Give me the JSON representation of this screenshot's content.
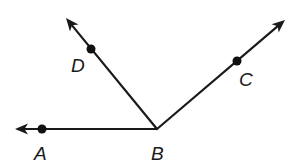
{
  "diagram": {
    "type": "angle-rays",
    "color": "#1a1a1a",
    "vertex": {
      "name": "B",
      "x": 157,
      "y": 129,
      "label": "B",
      "label_x": 151,
      "label_y": 160
    },
    "rays": [
      {
        "id": "ray-BA",
        "to_point": "A",
        "tip": {
          "x": 15,
          "y": 129
        },
        "point": {
          "name": "A",
          "x": 42,
          "y": 129
        },
        "label": "A",
        "label_x": 34,
        "label_y": 160
      },
      {
        "id": "ray-BD",
        "to_point": "D",
        "tip": {
          "x": 66,
          "y": 18
        },
        "point": {
          "name": "D",
          "x": 91,
          "y": 49
        },
        "label": "D",
        "label_x": 71,
        "label_y": 72
      },
      {
        "id": "ray-BC",
        "to_point": "C",
        "tip": {
          "x": 285,
          "y": 20
        },
        "point": {
          "name": "C",
          "x": 237,
          "y": 61
        },
        "label": "C",
        "label_x": 239,
        "label_y": 86
      }
    ]
  }
}
